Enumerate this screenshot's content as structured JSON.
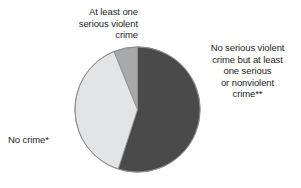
{
  "chart_data": {
    "type": "pie",
    "title": "",
    "subtitle": "",
    "xlabel": "",
    "ylabel": "",
    "grid": false,
    "legend_position": "none",
    "start_angle_deg": 0,
    "direction": "clockwise",
    "categories": [
      "No serious violent crime but at least one serious or nonviolent crime**",
      "No crime*",
      "At least one serious violent crime"
    ],
    "values": [
      55,
      39,
      6
    ],
    "value_unit": "percent",
    "colors": [
      "#4a4a4a",
      "#e3e4e6",
      "#a8a9ab"
    ],
    "slices": [
      {
        "label": "No serious violent crime but at least one serious or nonviolent crime**",
        "value": 55,
        "color": "#4a4a4a",
        "start_deg": 0,
        "end_deg": 198
      },
      {
        "label": "No crime*",
        "value": 39,
        "color": "#e3e4e6",
        "start_deg": 198,
        "end_deg": 338
      },
      {
        "label": "At least one serious violent crime",
        "value": 6,
        "color": "#a8a9ab",
        "start_deg": 338,
        "end_deg": 360
      }
    ],
    "annotations": [
      "At least one serious violent crime",
      "No serious violent crime but at least one serious or nonviolent crime**",
      "No crime*"
    ]
  },
  "labels": {
    "violent": "At least one\nserious violent\ncrime",
    "nonviolent": "No serious violent\ncrime but at least\none serious\nor nonviolent\ncrime**",
    "nocrime": "No crime*"
  },
  "style": {
    "background": "#ffffff",
    "outline": "#8a8a8a",
    "text": "#262626"
  }
}
